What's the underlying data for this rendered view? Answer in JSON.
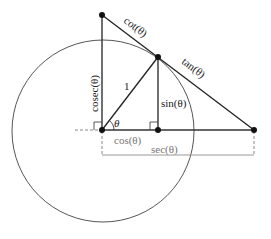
{
  "diagram": {
    "colors": {
      "line": "#222222",
      "circle": "#555555",
      "guide": "#888888",
      "label_gray": "#777777"
    },
    "labels": {
      "cot": "cot(θ)",
      "tan": "tan(θ)",
      "cosec": "cosec(θ)",
      "radius": "1",
      "sin": "sin(θ)",
      "theta": "θ",
      "cos": "cos(θ)",
      "sec": "sec(θ)"
    },
    "points": {
      "origin": [
        102,
        130
      ],
      "circle_point": [
        158,
        57
      ],
      "sin_foot": [
        158,
        130
      ],
      "cosec_top": [
        102,
        15
      ],
      "sec_end": [
        254,
        130
      ]
    },
    "circle": {
      "cx": 103,
      "cy": 131,
      "r": 91
    }
  }
}
